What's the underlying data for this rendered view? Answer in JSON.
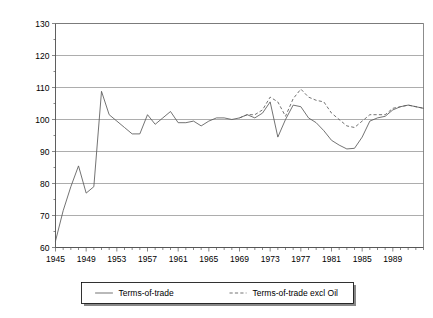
{
  "chart_data": {
    "type": "line",
    "title": "",
    "xlabel": "",
    "ylabel": "",
    "xlim": [
      1945,
      1993
    ],
    "ylim": [
      60,
      130
    ],
    "ytick_step": 10,
    "yticks": [
      60,
      70,
      80,
      90,
      100,
      110,
      120,
      130
    ],
    "xticks": [
      1945,
      1949,
      1953,
      1957,
      1961,
      1965,
      1969,
      1973,
      1977,
      1981,
      1985,
      1989
    ],
    "xtick_minor_step": 1,
    "grid": "horizontal",
    "legend_position": "bottom-outside",
    "x": [
      1945,
      1946,
      1947,
      1948,
      1949,
      1950,
      1951,
      1952,
      1953,
      1954,
      1955,
      1956,
      1957,
      1958,
      1959,
      1960,
      1961,
      1962,
      1963,
      1964,
      1965,
      1966,
      1967,
      1968,
      1969,
      1970,
      1971,
      1972,
      1973,
      1974,
      1975,
      1976,
      1977,
      1978,
      1979,
      1980,
      1981,
      1982,
      1983,
      1984,
      1985,
      1986,
      1987,
      1988,
      1989,
      1990,
      1991,
      1992,
      1993
    ],
    "series": [
      {
        "name": "Terms-of-trade",
        "style": "solid",
        "values": [
          62.0,
          71.5,
          79.0,
          85.5,
          77.0,
          79.0,
          108.8,
          101.5,
          99.5,
          97.5,
          95.5,
          95.5,
          101.5,
          98.5,
          100.5,
          102.5,
          99.0,
          99.0,
          99.5,
          98.0,
          99.5,
          100.5,
          100.5,
          100.0,
          100.5,
          101.5,
          100.5,
          102.0,
          105.5,
          94.5,
          100.0,
          104.5,
          104.0,
          100.5,
          99.0,
          96.5,
          93.5,
          92.0,
          90.8,
          91.0,
          94.5,
          99.5,
          100.5,
          101.0,
          103.0,
          104.0,
          104.5,
          104.0,
          103.5
        ]
      },
      {
        "name": "Terms-of-trade excl Oil",
        "style": "dashed",
        "values": [
          null,
          null,
          null,
          null,
          null,
          null,
          null,
          null,
          null,
          null,
          null,
          null,
          null,
          null,
          null,
          null,
          null,
          null,
          null,
          null,
          null,
          null,
          null,
          null,
          100.5,
          101.5,
          101.5,
          103.0,
          107.0,
          105.5,
          101.0,
          106.5,
          109.5,
          107.0,
          106.0,
          105.5,
          102.0,
          100.0,
          98.0,
          97.5,
          99.5,
          101.5,
          101.5,
          101.5,
          103.5,
          104.0,
          104.5,
          104.0,
          103.5
        ]
      }
    ]
  },
  "legend": {
    "items": [
      {
        "label": "Terms-of-trade",
        "style": "solid"
      },
      {
        "label": "Terms-of-trade excl Oil",
        "style": "dashed"
      }
    ]
  }
}
